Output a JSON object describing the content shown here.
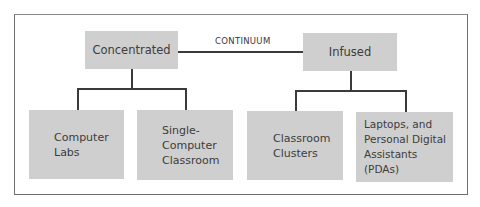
{
  "diagram": {
    "continuum_label": "CONTINUUM",
    "top_nodes": [
      {
        "label": "Concentrated"
      },
      {
        "label": "Infused"
      }
    ],
    "bottom_nodes": [
      {
        "label": "Computer\nLabs",
        "parent": "Concentrated"
      },
      {
        "label": "Single-\nComputer\nClassroom",
        "parent": "Concentrated"
      },
      {
        "label": "Classroom\nClusters",
        "parent": "Infused"
      },
      {
        "label": "Laptops, and\nPersonal Digital\nAssistants (PDAs)",
        "parent": "Infused"
      }
    ],
    "colors": {
      "box_fill": "#cfcfcf",
      "line": "#3a3a3a",
      "frame": "#6e6e6e"
    }
  }
}
